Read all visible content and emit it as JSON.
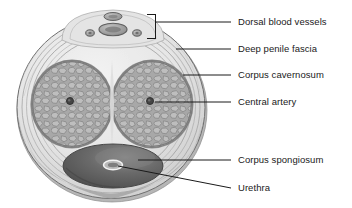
{
  "figure": {
    "background_color": "#ffffff",
    "width": 352,
    "height": 208
  },
  "palette": {
    "outline": "#6b6b6b",
    "fascia_light": "#e9e9e9",
    "fascia_mid": "#d4d4d4",
    "fascia_line": "#9a9a9a",
    "skin_shadow": "#a9a9a9",
    "cavernosum_fill": "#a6a6a6",
    "cavernosum_cell": "#bdbdbd",
    "cavernosum_cell_edge": "#8a8a8a",
    "cavernosum_rim": "#7d7d7d",
    "spongiosum_fill": "#5d5d5d",
    "spongiosum_light": "#8e8e8e",
    "artery_fill": "#4a4a4a",
    "vessel_fill": "#9c9c9c",
    "vessel_edge": "#6a6a6a",
    "urethra_outline": "#f2f2f2",
    "leader_line": "#1a1a1a",
    "label_color": "#1a1a1a"
  },
  "labels": [
    {
      "id": "dorsal-blood-vessels",
      "text": "Dorsal blood vessels",
      "x": 238,
      "y": 17,
      "leader": {
        "type": "bracket",
        "from_x": 231,
        "from_y": 22,
        "to_x": 155,
        "to_y": 22
      }
    },
    {
      "id": "deep-penile-fascia",
      "text": "Deep penile fascia",
      "x": 238,
      "y": 44,
      "leader": {
        "type": "line",
        "from_x": 231,
        "from_y": 49,
        "to_x": 176,
        "to_y": 49
      }
    },
    {
      "id": "corpus-cavernosum",
      "text": "Corpus cavernosum",
      "x": 238,
      "y": 70,
      "leader": {
        "type": "line",
        "from_x": 231,
        "from_y": 75,
        "to_x": 183,
        "to_y": 75
      }
    },
    {
      "id": "central-artery",
      "text": "Central artery",
      "x": 238,
      "y": 97,
      "leader": {
        "type": "line",
        "from_x": 231,
        "from_y": 102,
        "to_x": 155,
        "to_y": 102
      }
    },
    {
      "id": "corpus-spongiosum",
      "text": "Corpus spongiosum",
      "x": 238,
      "y": 155,
      "leader": {
        "type": "line",
        "from_x": 231,
        "from_y": 160,
        "to_x": 138,
        "to_y": 160
      }
    },
    {
      "id": "urethra",
      "text": "Urethra",
      "x": 238,
      "y": 183,
      "leader": {
        "type": "line",
        "from_x": 231,
        "from_y": 188,
        "to_x": 120,
        "to_y": 166
      }
    }
  ],
  "structures": {
    "outer_fascia": {
      "cx": 111,
      "cy": 108,
      "rx": 95,
      "ry": 92,
      "name": "Deep penile fascia"
    },
    "dorsal_vessels": [
      {
        "id": "superficial-dorsal-vein",
        "cx": 113,
        "cy": 16,
        "rx": 9,
        "ry": 4
      },
      {
        "id": "deep-dorsal-vein",
        "cx": 113,
        "cy": 29,
        "rx": 14,
        "ry": 6
      },
      {
        "id": "dorsal-artery-left",
        "cx": 90,
        "cy": 33,
        "rx": 4,
        "ry": 3
      },
      {
        "id": "dorsal-artery-right",
        "cx": 137,
        "cy": 33,
        "rx": 4,
        "ry": 3
      }
    ],
    "corpus_cavernosum_left": {
      "cx": 72,
      "cy": 104,
      "rx": 42,
      "ry": 45
    },
    "corpus_cavernosum_right": {
      "cx": 152,
      "cy": 104,
      "rx": 42,
      "ry": 45
    },
    "central_artery_left": {
      "cx": 70,
      "cy": 101,
      "r": 3.4
    },
    "central_artery_right": {
      "cx": 150,
      "cy": 101,
      "r": 3.4
    },
    "corpus_spongiosum": {
      "cx": 113,
      "cy": 166,
      "rx": 50,
      "ry": 22
    },
    "urethra": {
      "cx": 113,
      "cy": 165,
      "rx": 9,
      "ry": 4.5
    }
  }
}
